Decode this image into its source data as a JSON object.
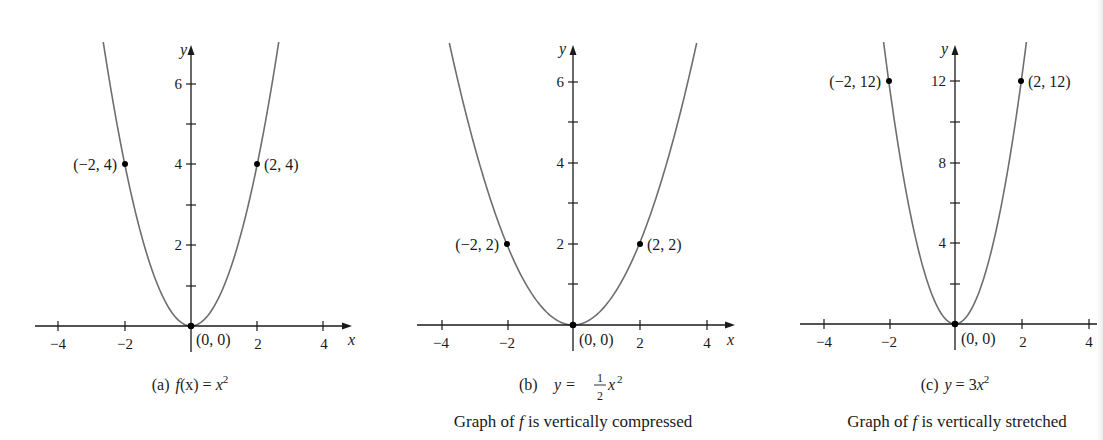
{
  "chart_data": [
    {
      "type": "line",
      "panel": "a",
      "caption_prefix": "(a)",
      "caption_math": "f(x) = x²",
      "subtitle": "",
      "function": "x^2",
      "coefficient": 1,
      "xlabel": "x",
      "ylabel": "y",
      "xlim": [
        -4.7,
        4.9
      ],
      "ylim": [
        -0.6,
        7.0
      ],
      "x_ticks": [
        -4,
        -2,
        2,
        4
      ],
      "x_tick_labels": [
        "−4",
        "−2",
        "2",
        "4"
      ],
      "y_ticks": [
        1,
        2,
        3,
        4,
        5,
        6
      ],
      "y_tick_labels": {
        "2": "2",
        "4": "4",
        "6": "6"
      },
      "points": [
        {
          "x": -2,
          "y": 4,
          "label": "(−2, 4)"
        },
        {
          "x": 0,
          "y": 0,
          "label": "(0, 0)"
        },
        {
          "x": 2,
          "y": 4,
          "label": "(2, 4)"
        }
      ],
      "grid": false
    },
    {
      "type": "line",
      "panel": "b",
      "caption_prefix": "(b)",
      "caption_math": "y = ½x²",
      "subtitle": "Graph of f is vertically compressed",
      "function": "0.5*x^2",
      "coefficient": 0.5,
      "xlabel": "x",
      "ylabel": "y",
      "xlim": [
        -4.7,
        4.9
      ],
      "ylim": [
        -0.6,
        7.0
      ],
      "x_ticks": [
        -4,
        -2,
        2,
        4
      ],
      "x_tick_labels": [
        "−4",
        "−2",
        "2",
        "4"
      ],
      "y_ticks": [
        1,
        2,
        3,
        4,
        5,
        6
      ],
      "y_tick_labels": {
        "2": "2",
        "4": "4",
        "6": "6"
      },
      "points": [
        {
          "x": -2,
          "y": 2,
          "label": "(−2, 2)"
        },
        {
          "x": 0,
          "y": 0,
          "label": "(0, 0)"
        },
        {
          "x": 2,
          "y": 2,
          "label": "(2, 2)"
        }
      ],
      "grid": false
    },
    {
      "type": "line",
      "panel": "c",
      "caption_prefix": "(c)",
      "caption_math": "y = 3x²",
      "subtitle": "Graph of f is vertically stretched",
      "function": "3*x^2",
      "coefficient": 3,
      "xlabel": "",
      "ylabel": "y",
      "xlim": [
        -4.7,
        4.5
      ],
      "ylim": [
        -1.2,
        14.0
      ],
      "x_ticks": [
        -4,
        -2,
        2,
        4
      ],
      "x_tick_labels": [
        "−4",
        "−2",
        "2",
        "4"
      ],
      "y_ticks": [
        2,
        4,
        6,
        8,
        10,
        12
      ],
      "y_tick_labels": {
        "4": "4",
        "8": "8",
        "12": "12"
      },
      "points": [
        {
          "x": -2,
          "y": 12,
          "label": "(−2, 12)"
        },
        {
          "x": 0,
          "y": 0,
          "label": "(0, 0)"
        },
        {
          "x": 2,
          "y": 12,
          "label": "(2, 12)"
        }
      ],
      "grid": false
    }
  ],
  "labels": {
    "a": {
      "prefix": "(a)",
      "f": "f",
      "x_in": "(x)",
      "eq": " = ",
      "x": "x",
      "sup": "2",
      "p_left": "(−2, 4)",
      "p_right": "(2, 4)",
      "p_origin": "(0, 0)",
      "t_m4": "−4",
      "t_m2": "−2",
      "t_2": "2",
      "t_4": "4",
      "y2": "2",
      "y4": "4",
      "y6": "6",
      "xlabel": "x",
      "ylabel": "y"
    },
    "b": {
      "prefix": "(b)",
      "y": "y",
      "eq": " = ",
      "num": "1",
      "den": "2",
      "x": "x",
      "sup": "2",
      "subtitle": "Graph of f is vertically compressed",
      "sub_pre": "Graph of ",
      "sub_f": "f",
      "sub_post": " is vertically compressed",
      "p_left": "(−2, 2)",
      "p_right": "(2, 2)",
      "p_origin": "(0, 0)",
      "t_m4": "−4",
      "t_m2": "−2",
      "t_2": "2",
      "t_4": "4",
      "y2": "2",
      "y4": "4",
      "y6": "6",
      "xlabel": "x",
      "ylabel": "y"
    },
    "c": {
      "prefix": "(c)",
      "y": "y",
      "eq": " = 3",
      "x": "x",
      "sup": "2",
      "subtitle": "Graph of f is vertically stretched",
      "sub_pre": "Graph of ",
      "sub_f": "f",
      "sub_post": " is vertically stretched",
      "p_left": "(−2, 12)",
      "p_right": "(2, 12)",
      "p_origin": "(0, 0)",
      "t_m4": "−4",
      "t_m2": "−2",
      "t_2": "2",
      "t_4": "4",
      "y4": "4",
      "y8": "8",
      "y12": "12",
      "ylabel": "y"
    }
  }
}
